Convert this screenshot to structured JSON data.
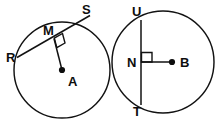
{
  "figure": {
    "type": "geometry-diagram",
    "stroke_color": "#121212",
    "background_color": "#ffffff",
    "label_color": "#0d0d0d"
  },
  "circles": [
    {
      "id": "circle-a",
      "center_label": "A",
      "center": {
        "x": 62,
        "y": 70
      },
      "radius": 48,
      "chord": {
        "label_start": "R",
        "label_end": "S",
        "midpoint_label": "M",
        "start": {
          "x": 18,
          "y": 57
        },
        "end": {
          "x": 84,
          "y": 19
        },
        "midpoint": {
          "x": 54,
          "y": 38
        }
      },
      "perpendicular_mark": true,
      "labels": [
        {
          "text": "S",
          "x": 82,
          "y": 14
        },
        {
          "text": "M",
          "x": 43,
          "y": 35
        },
        {
          "text": "R",
          "x": 6,
          "y": 62
        },
        {
          "text": "A",
          "x": 68,
          "y": 86
        }
      ]
    },
    {
      "id": "circle-b",
      "center_label": "B",
      "center": {
        "x": 173,
        "y": 62
      },
      "radius": 51,
      "chord": {
        "label_start": "U",
        "label_end": "T",
        "midpoint_label": "N",
        "start": {
          "x": 141,
          "y": 23
        },
        "end": {
          "x": 141,
          "y": 101
        },
        "midpoint": {
          "x": 141,
          "y": 62
        }
      },
      "perpendicular_mark": true,
      "labels": [
        {
          "text": "U",
          "x": 134,
          "y": 16
        },
        {
          "text": "N",
          "x": 128,
          "y": 67
        },
        {
          "text": "B",
          "x": 182,
          "y": 67
        },
        {
          "text": "T",
          "x": 134,
          "y": 115
        }
      ]
    }
  ]
}
